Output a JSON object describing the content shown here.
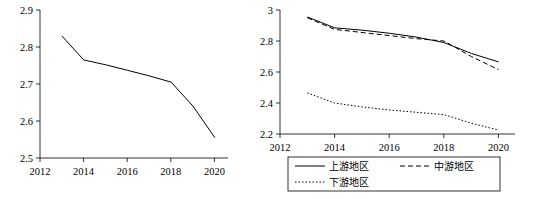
{
  "chart_data": [
    {
      "id": "left",
      "type": "line",
      "title": "",
      "xlabel": "",
      "ylabel": "",
      "xlim": [
        2012,
        2020.6
      ],
      "ylim": [
        2.5,
        2.9
      ],
      "xticks": [
        "2012",
        "2014",
        "2016",
        "2018",
        "2020"
      ],
      "xtick_values": [
        2012,
        2014,
        2016,
        2018,
        2020
      ],
      "yticks": [
        "2.5",
        "2.6",
        "2.7",
        "2.8",
        "2.9"
      ],
      "ytick_values": [
        2.5,
        2.6,
        2.7,
        2.8,
        2.9
      ],
      "grid": false,
      "legend": "none",
      "series": [
        {
          "name": "",
          "style": "solid",
          "x": [
            2013,
            2014,
            2015,
            2016,
            2017,
            2018,
            2019,
            2020
          ],
          "values": [
            2.83,
            2.765,
            2.752,
            2.737,
            2.722,
            2.705,
            2.64,
            2.555
          ]
        }
      ]
    },
    {
      "id": "right",
      "type": "line",
      "title": "",
      "xlabel": "",
      "ylabel": "",
      "xlim": [
        2012,
        2020.6
      ],
      "ylim": [
        2.2,
        3.0
      ],
      "xticks": [
        "2012",
        "2014",
        "2016",
        "2018",
        "2020"
      ],
      "xtick_values": [
        2012,
        2014,
        2016,
        2018,
        2020
      ],
      "yticks": [
        "2.2",
        "2.4",
        "2.6",
        "2.8",
        "3"
      ],
      "ytick_values": [
        2.2,
        2.4,
        2.6,
        2.8,
        3.0
      ],
      "grid": false,
      "legend": "bottom",
      "series": [
        {
          "name": "上游地区",
          "style": "solid",
          "x": [
            2013,
            2014,
            2015,
            2016,
            2017,
            2018,
            2019,
            2020
          ],
          "values": [
            2.955,
            2.885,
            2.87,
            2.85,
            2.825,
            2.79,
            2.72,
            2.665
          ]
        },
        {
          "name": "中游地区",
          "style": "dashed",
          "x": [
            2013,
            2014,
            2015,
            2016,
            2017,
            2018,
            2019,
            2020
          ],
          "values": [
            2.95,
            2.875,
            2.855,
            2.835,
            2.815,
            2.8,
            2.7,
            2.615
          ]
        },
        {
          "name": "下游地区",
          "style": "dotted",
          "x": [
            2013,
            2014,
            2015,
            2016,
            2017,
            2018,
            2019,
            2020
          ],
          "values": [
            2.465,
            2.4,
            2.375,
            2.355,
            2.34,
            2.325,
            2.27,
            2.225
          ]
        }
      ]
    }
  ],
  "legend": {
    "items": [
      {
        "label": "上游地区",
        "style": "solid"
      },
      {
        "label": "中游地区",
        "style": "dashed"
      },
      {
        "label": "下游地区",
        "style": "dotted"
      }
    ]
  }
}
